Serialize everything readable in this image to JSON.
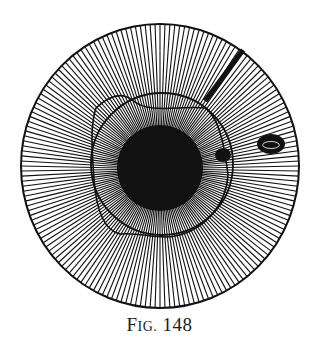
{
  "caption": {
    "prefix_big": "F",
    "prefix_small": "IG.",
    "number": "148"
  },
  "diagram": {
    "ink_color": "#111111",
    "outer_circle": {
      "cx": 160,
      "cy": 166,
      "rx": 139,
      "ry": 142,
      "stroke_width": 2
    },
    "spokes": {
      "count": 176,
      "stroke_width": 1.1
    },
    "central_mass": {
      "cx": 160,
      "cy": 168,
      "r": 43
    },
    "inner_ring": {
      "cx": 162,
      "cy": 164,
      "rx": 71,
      "ry": 71
    },
    "wavy_contour": "M 96 108 C 110 95, 122 92, 132 100 C 150 115, 180 105, 205 108 C 220 118, 225 150, 228 175 C 226 205, 205 230, 175 236 C 160 240, 140 232, 120 234 C 102 230, 96 205, 94 180 C 92 150, 90 125, 96 108 Z",
    "thick_bar": {
      "x1": 243,
      "y1": 50,
      "x2": 205,
      "y2": 101,
      "width": 5
    },
    "small_blob": {
      "cx": 223,
      "cy": 155,
      "rx": 8,
      "ry": 7
    },
    "oval_blob": {
      "cx": 271,
      "cy": 144,
      "rx": 14,
      "ry": 10
    }
  }
}
